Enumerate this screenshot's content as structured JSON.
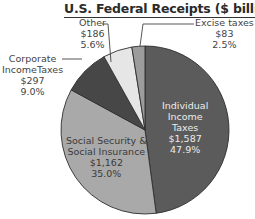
{
  "chart_data": {
    "type": "pie",
    "title": "U.S. Federal Receipts ($ billions)",
    "slices": [
      {
        "label": "Individual Income Taxes",
        "value": 1587,
        "display_value": "$1,587",
        "percent": "47.9%",
        "color": "#5b5b5b"
      },
      {
        "label": "Social Security & Social Insurance",
        "value": 1162,
        "display_value": "$1,162",
        "percent": "35.0%",
        "color": "#a9a9a9"
      },
      {
        "label": "Corporate Income Taxes",
        "value": 297,
        "display_value": "$297",
        "percent": "9.0%",
        "color": "#474747"
      },
      {
        "label": "Other",
        "value": 186,
        "display_value": "$186",
        "percent": "5.6%",
        "color": "#e6e6e6"
      },
      {
        "label": "Excise taxes",
        "value": 83,
        "display_value": "$83",
        "percent": "2.5%",
        "color": "#9c9c9c"
      }
    ],
    "legend": "none (labels placed inline and with leader lines)"
  },
  "labels": {
    "title": "U.S. Federal Receipts ($ billions)",
    "individual": {
      "l1": "Individual",
      "l2": "Income",
      "l3": "Taxes",
      "value": "$1,587",
      "pct": "47.9%"
    },
    "social": {
      "l1": "Social Security &",
      "l2": "Social Insurance",
      "value": "$1,162",
      "pct": "35.0%"
    },
    "corporate": {
      "l1": "Corporate",
      "l2": "IncomeTaxes",
      "value": "$297",
      "pct": "9.0%"
    },
    "other": {
      "l1": "Other",
      "value": "$186",
      "pct": "5.6%"
    },
    "excise": {
      "l1": "Excise taxes",
      "value": "$83",
      "pct": "2.5%"
    }
  }
}
